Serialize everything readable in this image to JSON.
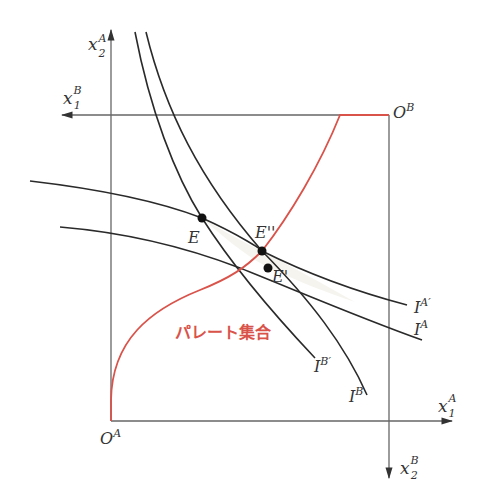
{
  "diagram": {
    "type": "Edgeworth box",
    "colors": {
      "axis": "#666666",
      "curve": "#2a2a2a",
      "pareto": "#d9534a",
      "lens_fill": "#f6f4ee",
      "label": "#333333"
    },
    "axes": {
      "x2A": {
        "base": "x",
        "sub": "2",
        "sup": "A"
      },
      "x1B": {
        "base": "x",
        "sub": "1",
        "sup": "B"
      },
      "x1A": {
        "base": "x",
        "sub": "1",
        "sup": "A"
      },
      "x2B": {
        "base": "x",
        "sub": "2",
        "sup": "B"
      }
    },
    "origins": {
      "OA": {
        "base": "O",
        "sup": "A"
      },
      "OB": {
        "base": "O",
        "sup": "B"
      }
    },
    "points": {
      "E": {
        "label": "E"
      },
      "E_double_prime": {
        "label": "E''"
      },
      "E_prime": {
        "label": "E'"
      }
    },
    "curves": {
      "IA_prime": {
        "base": "I",
        "sup": "A′"
      },
      "IA": {
        "base": "I",
        "sup": "A"
      },
      "IB_prime": {
        "base": "I",
        "sup": "B′"
      },
      "IB": {
        "base": "I",
        "sup": "B"
      }
    },
    "pareto_label": "パレート集合"
  }
}
